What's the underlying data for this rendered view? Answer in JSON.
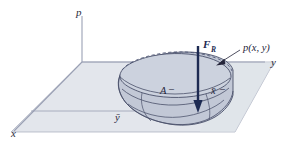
{
  "figure": {
    "background_color": "#ffffff"
  },
  "colors": {
    "plane_fill": "#e3e6ec",
    "plane_edge": "#8d93a8",
    "axis_line": "#9aa0b4",
    "solid_fill": "#c2c8d6",
    "solid_edge": "#4a506a",
    "arrow": "#1d2a52",
    "label_text": "#25253a",
    "dashed_line": "#5b6384"
  },
  "axes": [
    {
      "id": "p-axis",
      "label": "p",
      "orientation": "vertical"
    },
    {
      "id": "y-axis",
      "label": "y",
      "orientation": "horizontal-right"
    },
    {
      "id": "x-axis",
      "label": "x",
      "orientation": "diagonal-lower-left"
    }
  ],
  "labels": {
    "p_axis": "p",
    "y_axis": "y",
    "x_axis": "x",
    "resultant_force": "F",
    "resultant_force_subscript": "R",
    "pressure_function": "p(x, y)",
    "area": "A",
    "area_dash": "–",
    "x_bar": "x̄",
    "x_bar_dash": "–",
    "y_bar": "ȳ"
  },
  "annotations": [
    {
      "name": "pressure-function-callout",
      "text": "p(x, y)",
      "points_to": "top surface of pressure solid"
    },
    {
      "name": "resultant-force-vector",
      "text": "F_R",
      "direction": "downward",
      "acts_at": "centroid of pressure volume"
    },
    {
      "name": "area-callout",
      "text": "A",
      "points_to": "planar area in x-y plane"
    },
    {
      "name": "centroid-x-coordinate",
      "text": "x̄"
    },
    {
      "name": "centroid-y-coordinate",
      "text": "ȳ"
    }
  ]
}
